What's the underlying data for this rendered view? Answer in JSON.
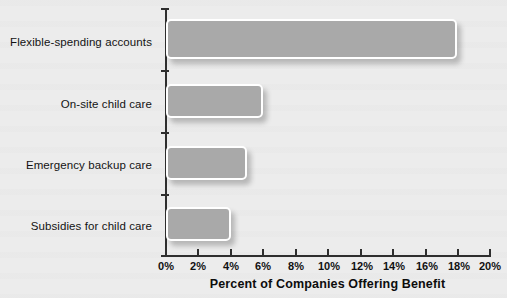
{
  "chart_data": {
    "type": "bar",
    "orientation": "horizontal",
    "title": "",
    "subtitle": "",
    "xlabel": "Percent of Companies Offering Benefit",
    "ylabel": "",
    "categories": [
      "Flexible-spending accounts",
      "On-site child care",
      "Emergency backup care",
      "Subsidies for child care"
    ],
    "values": [
      18,
      6,
      5,
      4
    ],
    "xlim": [
      0,
      20
    ],
    "xticks": [
      0,
      2,
      4,
      6,
      8,
      10,
      12,
      14,
      16,
      18,
      20
    ],
    "xtick_labels": [
      "0%",
      "2%",
      "4%",
      "6%",
      "8%",
      "10%",
      "12%",
      "14%",
      "16%",
      "18%",
      "20%"
    ],
    "grid": false,
    "legend": null,
    "bar_color": "#a9a9a9",
    "bar_border_color": "#ffffff",
    "axis_color": "#2e2e2e",
    "background_color": "#ececec"
  }
}
